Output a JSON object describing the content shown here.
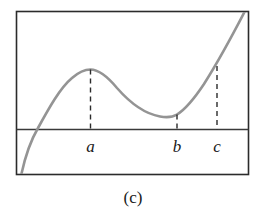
{
  "figure": {
    "caption": "(c)",
    "frame": {
      "x": 16.5,
      "y": 11.5,
      "width": 232,
      "height": 163,
      "stroke": "#2b2b2b",
      "stroke_width": 1.6
    },
    "axis": {
      "label": "x-axis",
      "y": 129.5,
      "x1": 16.5,
      "x2": 248.5,
      "stroke": "#3a3a3a",
      "stroke_width": 1.6
    },
    "curve": {
      "label": "cubic-like curve with local max at a, local min at b",
      "stroke": "#949494",
      "stroke_width": 2.6,
      "path": "M 21 176 C 26 152, 31 140, 38 128 C 49 108, 60 88, 72 78 C 80 71, 86 69.5, 90.5 69.5 C 99 69.5, 107 76, 117 88 C 131 104, 146 114, 160 116.5 C 168 118, 173 117, 177 114.5 C 186 109, 194 99, 204 84 C 216 65, 230 40, 245 11"
    },
    "markers": [
      {
        "name": "a",
        "label": "a",
        "x": 90.5,
        "curve_y": 69.5,
        "axis_y": 129.5,
        "label_x": 90.5,
        "label_y": 152
      },
      {
        "name": "b",
        "label": "b",
        "x": 177,
        "curve_y": 114.5,
        "axis_y": 129.5,
        "label_x": 177,
        "label_y": 152
      },
      {
        "name": "c",
        "label": "c",
        "x": 217,
        "curve_y": 66,
        "axis_y": 129.5,
        "label_x": 217,
        "label_y": 152
      }
    ],
    "dash": {
      "stroke": "#2b2b2b",
      "stroke_width": 1.4,
      "pattern": "5,4"
    },
    "caption_position": {
      "x": 133,
      "y": 203
    }
  },
  "chart_data": {
    "type": "line",
    "title": "(c)",
    "xlabel": "",
    "ylabel": "",
    "grid": false,
    "legend": null,
    "annotations": [
      "a",
      "b",
      "c"
    ],
    "series": [
      {
        "name": "f(x)",
        "x": [
          21,
          30,
          38,
          50,
          60,
          72,
          80,
          90.5,
          100,
          110,
          120,
          135,
          150,
          165,
          177,
          190,
          204,
          217,
          232,
          245
        ],
        "y": [
          176,
          148,
          128,
          106,
          93,
          78,
          71,
          69.5,
          71,
          78,
          89,
          104,
          112,
          116,
          114.5,
          105,
          84,
          66,
          38,
          11
        ]
      }
    ],
    "markers": [
      {
        "label": "a",
        "x": 90.5,
        "y": 69.5,
        "kind": "local-maximum"
      },
      {
        "label": "b",
        "x": 177,
        "y": 114.5,
        "kind": "local-minimum"
      },
      {
        "label": "c",
        "x": 217,
        "y": 66,
        "kind": "reference-point"
      }
    ],
    "axis_line_y": 129.5,
    "xlim": [
      16.5,
      248.5
    ],
    "ylim": [
      174.5,
      11.5
    ]
  }
}
